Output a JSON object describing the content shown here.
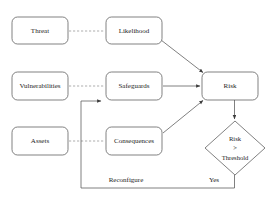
{
  "diagram": {
    "colors": {
      "background": "#ffffff",
      "node_stroke": "#4a4a4a",
      "edge_solid": "#555555",
      "edge_dashed": "#8a8a8a",
      "text": "#1c1c1c"
    },
    "nodes": [
      {
        "id": "threat",
        "label": "Threat",
        "shape": "rounded-rect",
        "x": 12,
        "y": 17,
        "w": 56,
        "h": 27
      },
      {
        "id": "likelihood",
        "label": "Likelihood",
        "shape": "rounded-rect",
        "x": 106,
        "y": 17,
        "w": 56,
        "h": 27
      },
      {
        "id": "vulnerabilities",
        "label": "Vulnerabilities",
        "shape": "rounded-rect",
        "x": 12,
        "y": 72,
        "w": 56,
        "h": 28
      },
      {
        "id": "safeguards",
        "label": "Safeguards",
        "shape": "rounded-rect",
        "x": 106,
        "y": 72,
        "w": 56,
        "h": 28
      },
      {
        "id": "assets",
        "label": "Assets",
        "shape": "rounded-rect",
        "x": 12,
        "y": 127,
        "w": 56,
        "h": 28
      },
      {
        "id": "consequences",
        "label": "Consequences",
        "shape": "rounded-rect",
        "x": 106,
        "y": 127,
        "w": 56,
        "h": 28
      },
      {
        "id": "risk",
        "label": "Risk",
        "shape": "rounded-rect",
        "x": 202,
        "y": 72,
        "w": 56,
        "h": 28
      }
    ],
    "decision": {
      "id": "risk-threshold",
      "shape": "diamond",
      "cx": 235,
      "cy": 148,
      "rx": 30,
      "ry": 27,
      "line1": "Risk",
      "line2": ">",
      "line3": "Threshold"
    },
    "edges": [
      {
        "id": "threat-likelihood",
        "from": "threat",
        "to": "likelihood",
        "style": "dashed",
        "arrow": false
      },
      {
        "id": "vuln-safeguards",
        "from": "vulnerabilities",
        "to": "safeguards",
        "style": "dashed",
        "arrow": false
      },
      {
        "id": "assets-consequences",
        "from": "assets",
        "to": "consequences",
        "style": "dashed",
        "arrow": false
      },
      {
        "id": "likelihood-risk",
        "from": "likelihood",
        "to": "risk",
        "style": "solid",
        "arrow": true
      },
      {
        "id": "safeguards-risk",
        "from": "safeguards",
        "to": "risk",
        "style": "solid",
        "arrow": true
      },
      {
        "id": "consequences-risk",
        "from": "consequences",
        "to": "risk",
        "style": "solid",
        "arrow": true
      },
      {
        "id": "risk-threshold-edge",
        "from": "risk",
        "to": "risk-threshold",
        "style": "solid",
        "arrow": true
      },
      {
        "id": "feedback-loop",
        "from": "risk-threshold",
        "to": "safeguards",
        "style": "solid",
        "arrow": true
      }
    ],
    "edge_labels": [
      {
        "id": "reconfigure-label",
        "text": "Reconfigure",
        "x": 126,
        "y": 180
      },
      {
        "id": "yes-label",
        "text": "Yes",
        "x": 214,
        "y": 180
      }
    ]
  }
}
